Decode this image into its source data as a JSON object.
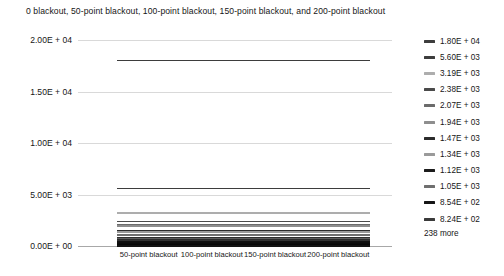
{
  "chart_data": {
    "type": "line",
    "title": "0 blackout, 50-point blackout, 100-point blackout, 150-point blackout, and 200-point blackout",
    "xlabel": "",
    "ylabel": "",
    "grid": true,
    "legend_position": "right",
    "categories": [
      "50-point blackout",
      "100-point blackout",
      "150-point blackout",
      "200-point blackout"
    ],
    "ylim": [
      0,
      20000
    ],
    "yticks": [
      0,
      5000,
      10000,
      15000,
      20000
    ],
    "ytick_labels": [
      "0.00E + 00",
      "5.00E + 03",
      "1.00E + 04",
      "1.50E + 04",
      "2.00E + 04"
    ],
    "series": [
      {
        "name": "1.80E + 04",
        "value": 18000,
        "color": "#3d3d3d"
      },
      {
        "name": "5.60E + 03",
        "value": 5600,
        "color": "#3d3d3d"
      },
      {
        "name": "3.19E + 03",
        "value": 3190,
        "color": "#adadad"
      },
      {
        "name": "2.38E + 03",
        "value": 2380,
        "color": "#4a4a4a"
      },
      {
        "name": "2.07E + 03",
        "value": 2070,
        "color": "#6b6b6b"
      },
      {
        "name": "1.94E + 03",
        "value": 1940,
        "color": "#8e8e8e"
      },
      {
        "name": "1.47E + 03",
        "value": 1470,
        "color": "#2b2b2b"
      },
      {
        "name": "1.34E + 03",
        "value": 1340,
        "color": "#9a9a9a"
      },
      {
        "name": "1.12E + 03",
        "value": 1120,
        "color": "#1c1c1c"
      },
      {
        "name": "1.05E + 03",
        "value": 1050,
        "color": "#6f6f6f"
      },
      {
        "name": "8.54E + 02",
        "value": 854,
        "color": "#161616"
      },
      {
        "name": "8.24E + 02",
        "value": 824,
        "color": "#3a3a3a"
      },
      {
        "name": "hidden-01",
        "value": 790,
        "color": "#2e2e2e"
      },
      {
        "name": "hidden-02",
        "value": 752,
        "color": "#4f4f4f"
      },
      {
        "name": "hidden-03",
        "value": 715,
        "color": "#252525"
      },
      {
        "name": "hidden-04",
        "value": 681,
        "color": "#5c5c5c"
      },
      {
        "name": "hidden-05",
        "value": 648,
        "color": "#1f1f1f"
      },
      {
        "name": "hidden-06",
        "value": 612,
        "color": "#414141"
      },
      {
        "name": "hidden-07",
        "value": 578,
        "color": "#2a2a2a"
      },
      {
        "name": "hidden-08",
        "value": 545,
        "color": "#565656"
      },
      {
        "name": "hidden-09",
        "value": 512,
        "color": "#1a1a1a"
      },
      {
        "name": "hidden-10",
        "value": 480,
        "color": "#333333"
      },
      {
        "name": "hidden-11",
        "value": 449,
        "color": "#222222"
      },
      {
        "name": "hidden-12",
        "value": 418,
        "color": "#454545"
      },
      {
        "name": "hidden-13",
        "value": 388,
        "color": "#111111"
      },
      {
        "name": "hidden-14",
        "value": 358,
        "color": "#2c2c2c"
      },
      {
        "name": "hidden-15",
        "value": 330,
        "color": "#1e1e1e"
      },
      {
        "name": "hidden-16",
        "value": 302,
        "color": "#383838"
      },
      {
        "name": "hidden-17",
        "value": 275,
        "color": "#0f0f0f"
      },
      {
        "name": "hidden-18",
        "value": 249,
        "color": "#262626"
      },
      {
        "name": "hidden-19",
        "value": 224,
        "color": "#151515"
      },
      {
        "name": "hidden-20",
        "value": 199,
        "color": "#303030"
      },
      {
        "name": "hidden-21",
        "value": 175,
        "color": "#0c0c0c"
      },
      {
        "name": "hidden-22",
        "value": 152,
        "color": "#1d1d1d"
      },
      {
        "name": "hidden-23",
        "value": 130,
        "color": "#101010"
      },
      {
        "name": "hidden-24",
        "value": 109,
        "color": "#282828"
      },
      {
        "name": "hidden-25",
        "value": 89,
        "color": "#080808"
      },
      {
        "name": "hidden-26",
        "value": 70,
        "color": "#191919"
      },
      {
        "name": "hidden-27",
        "value": 52,
        "color": "#0d0d0d"
      },
      {
        "name": "hidden-28",
        "value": 36,
        "color": "#202020"
      },
      {
        "name": "hidden-29",
        "value": 22,
        "color": "#060606"
      },
      {
        "name": "hidden-30",
        "value": 10,
        "color": "#131313"
      }
    ]
  },
  "legend": {
    "entries": [
      {
        "label": "1.80E + 04",
        "color": "#3d3d3d"
      },
      {
        "label": "5.60E + 03",
        "color": "#3d3d3d"
      },
      {
        "label": "3.19E + 03",
        "color": "#adadad"
      },
      {
        "label": "2.38E + 03",
        "color": "#4a4a4a"
      },
      {
        "label": "2.07E + 03",
        "color": "#6b6b6b"
      },
      {
        "label": "1.94E + 03",
        "color": "#8e8e8e"
      },
      {
        "label": "1.47E + 03",
        "color": "#2b2b2b"
      },
      {
        "label": "1.34E + 03",
        "color": "#9a9a9a"
      },
      {
        "label": "1.12E + 03",
        "color": "#1c1c1c"
      },
      {
        "label": "1.05E + 03",
        "color": "#6f6f6f"
      },
      {
        "label": "8.54E + 02",
        "color": "#161616"
      },
      {
        "label": "8.24E + 02",
        "color": "#3a3a3a"
      }
    ],
    "more_label": "238 more"
  },
  "colors": {
    "gridline": "#d9d9d9",
    "axis": "#a8a8a8",
    "text": "#161616",
    "background": "#ffffff"
  }
}
